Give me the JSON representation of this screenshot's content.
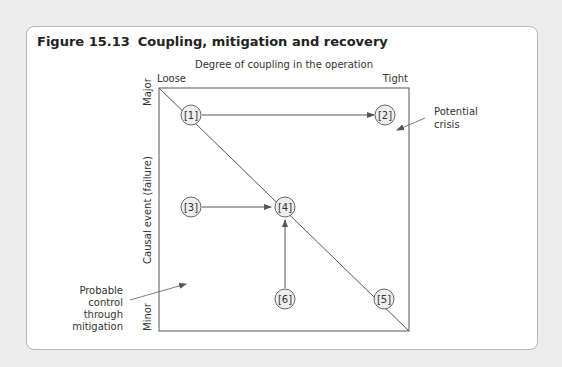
{
  "figure": {
    "number": "Figure 15.13",
    "title": "Coupling, mitigation and recovery"
  },
  "axes": {
    "x_title": "Degree of coupling in the operation",
    "x_left": "Loose",
    "x_right": "Tight",
    "y_title": "Causal event (failure)",
    "y_top": "Major",
    "y_bottom": "Minor"
  },
  "nodes": [
    {
      "id": "1",
      "label": "[1]"
    },
    {
      "id": "2",
      "label": "[2]"
    },
    {
      "id": "3",
      "label": "[3]"
    },
    {
      "id": "4",
      "label": "[4]"
    },
    {
      "id": "5",
      "label": "[5]"
    },
    {
      "id": "6",
      "label": "[6]"
    }
  ],
  "edges": [
    {
      "from": "1",
      "to": "2"
    },
    {
      "from": "3",
      "to": "4"
    },
    {
      "from": "6",
      "to": "4"
    }
  ],
  "annotations": {
    "potential_crisis": [
      "Potential",
      "crisis"
    ],
    "probable_control": [
      "Probable",
      "control",
      "through",
      "mitigation"
    ]
  }
}
